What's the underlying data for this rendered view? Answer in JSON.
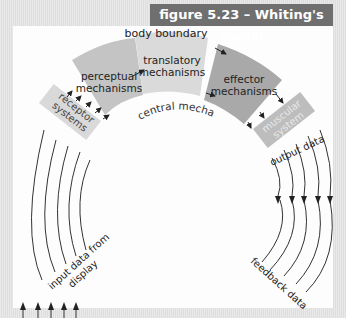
{
  "figure": {
    "title": "figure 5.23 – Whiting's model"
  },
  "labels": {
    "body_boundary": "body boundary",
    "central_mechanisms": "central mechanisms",
    "perceptual": [
      "perceptual",
      "mechanisms"
    ],
    "translatory": [
      "translatory",
      "mechanisms"
    ],
    "effector": [
      "effector",
      "mechanisms"
    ],
    "receptor": [
      "receptor",
      "systems"
    ],
    "muscular": [
      "muscular",
      "system"
    ],
    "output_data": "output data",
    "input_data": [
      "input data from",
      "display"
    ],
    "feedback_data": "feedback data"
  },
  "colors": {
    "header": "#6f6f6f",
    "perceptual": "#c4c4c4",
    "translatory": "#dadada",
    "effector": "#a9a9a9",
    "receptor": "#d9d9d9",
    "muscular": "#bdbdbd"
  }
}
